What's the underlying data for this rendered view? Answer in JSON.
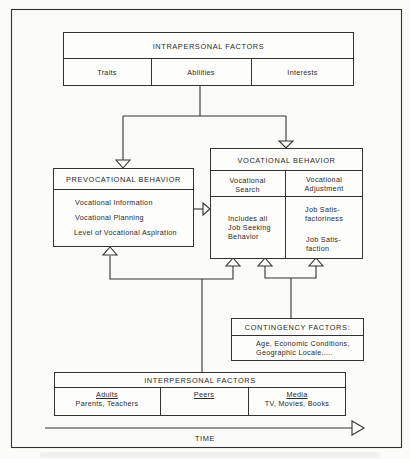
{
  "intrapersonal": {
    "title": "INTRAPERSONAL FACTORS",
    "items": [
      "Traits",
      "Abilities",
      "Interests"
    ]
  },
  "prevocational": {
    "title": "PREVOCATIONAL BEHAVIOR",
    "items": [
      "Vocational Information",
      "Vocational Planning",
      "Level of Vocational Aspiration"
    ]
  },
  "vocational": {
    "title": "VOCATIONAL BEHAVIOR",
    "columns": [
      {
        "header_1": "Vocational",
        "header_2": "Search",
        "body_1": "Includes all",
        "body_2": "Job Seeking",
        "body_3": "Behavior"
      },
      {
        "header_1": "Vocational",
        "header_2": "Adjustment",
        "body_1": "Job Satis-",
        "body_2": "factoriness",
        "body_3": "Job Satis-",
        "body_4": "faction"
      }
    ]
  },
  "contingency": {
    "title": "CONTINGENCY FACTORS:",
    "line_1": "Age, Economic Conditions,",
    "line_2": "Geographic Locale....."
  },
  "interpersonal": {
    "title": "INTERPERSONAL FACTORS",
    "columns": [
      {
        "label": "Adults",
        "detail": "Parents, Teachers"
      },
      {
        "label": "Peers",
        "detail": ""
      },
      {
        "label": "Media",
        "detail": "TV, Movies, Books"
      }
    ]
  },
  "time_axis": {
    "label": "TIME"
  }
}
